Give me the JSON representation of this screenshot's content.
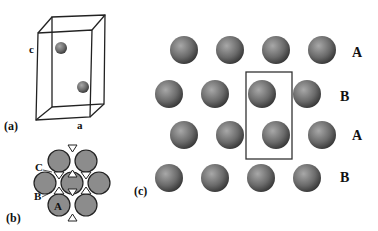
{
  "panels": {
    "a": {
      "label": "(a)",
      "axis_c": "c",
      "axis_a": "a",
      "atoms": [
        {
          "cx": 61,
          "cy": 48,
          "r": 6
        },
        {
          "cx": 83,
          "cy": 87,
          "r": 6
        }
      ]
    },
    "b": {
      "label": "(b)",
      "layer_labels": [
        "C",
        "B",
        "A"
      ]
    },
    "c": {
      "label": "(c)",
      "rows": [
        {
          "layer": "A",
          "y": 50,
          "xs": [
            184,
            230,
            276,
            322
          ]
        },
        {
          "layer": "B",
          "y": 94,
          "xs": [
            169,
            215,
            262,
            307
          ]
        },
        {
          "layer": "A",
          "y": 135,
          "xs": [
            184,
            230,
            276,
            322
          ]
        },
        {
          "layer": "B",
          "y": 178,
          "xs": [
            169,
            215,
            261,
            307
          ]
        }
      ],
      "row_labels": [
        "A",
        "B",
        "A",
        "B"
      ]
    }
  },
  "colors": {
    "sphere_light": "#9a9a9a",
    "sphere_dark": "#3a3a3a",
    "disk_fill": "#8c8c8c",
    "line": "#222222"
  }
}
